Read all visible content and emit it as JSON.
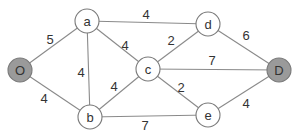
{
  "diagram": {
    "type": "weighted-undirected-graph",
    "colors": {
      "edge": "#8a8a8a",
      "node_stroke": "#7a7a7a",
      "node_fill": "#ffffff",
      "endpoint_fill": "#9a9a9a",
      "text": "#333333"
    },
    "nodes": [
      {
        "id": "O",
        "label": "O",
        "x": 20,
        "y": 70,
        "endpoint": true
      },
      {
        "id": "a",
        "label": "a",
        "x": 87,
        "y": 21,
        "endpoint": false
      },
      {
        "id": "b",
        "label": "b",
        "x": 90,
        "y": 117,
        "endpoint": false
      },
      {
        "id": "c",
        "label": "c",
        "x": 148,
        "y": 69,
        "endpoint": false
      },
      {
        "id": "d",
        "label": "d",
        "x": 208,
        "y": 24,
        "endpoint": false
      },
      {
        "id": "e",
        "label": "e",
        "x": 208,
        "y": 115,
        "endpoint": false
      },
      {
        "id": "D",
        "label": "D",
        "x": 279,
        "y": 70,
        "endpoint": true
      }
    ],
    "edges": [
      {
        "from": "O",
        "to": "a",
        "weight": "5",
        "lx": 50,
        "ly": 39
      },
      {
        "from": "O",
        "to": "b",
        "weight": "4",
        "lx": 44,
        "ly": 98
      },
      {
        "from": "a",
        "to": "b",
        "weight": "4",
        "lx": 81,
        "ly": 72
      },
      {
        "from": "a",
        "to": "c",
        "weight": "4",
        "lx": 125,
        "ly": 45
      },
      {
        "from": "a",
        "to": "d",
        "weight": "4",
        "lx": 146,
        "ly": 14
      },
      {
        "from": "b",
        "to": "c",
        "weight": "4",
        "lx": 114,
        "ly": 86
      },
      {
        "from": "b",
        "to": "e",
        "weight": "7",
        "lx": 145,
        "ly": 125
      },
      {
        "from": "c",
        "to": "d",
        "weight": "2",
        "lx": 171,
        "ly": 40
      },
      {
        "from": "c",
        "to": "D",
        "weight": "7",
        "lx": 212,
        "ly": 60
      },
      {
        "from": "c",
        "to": "e",
        "weight": "2",
        "lx": 181,
        "ly": 87
      },
      {
        "from": "d",
        "to": "D",
        "weight": "6",
        "lx": 246,
        "ly": 35
      },
      {
        "from": "e",
        "to": "D",
        "weight": "4",
        "lx": 246,
        "ly": 103
      }
    ],
    "node_radius": 12
  }
}
